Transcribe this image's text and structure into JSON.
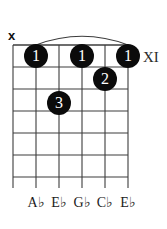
{
  "diagram": {
    "kind": "guitar-chord-diagram",
    "strings": 6,
    "frets": 6,
    "position_label": "XI",
    "colors": {
      "background": "#ffffff",
      "grid": "#3c3c3c",
      "dot_fill": "#0b0b0b",
      "dot_text": "#ffffff",
      "text": "#111111"
    },
    "geometry": {
      "string_x": [
        13,
        36,
        59,
        82,
        105,
        128
      ],
      "fret_y": [
        45,
        67,
        89,
        111,
        133,
        155,
        177
      ],
      "string_tail_y": 188,
      "nut_width": 1.6
    }
  },
  "mute_markers": [
    {
      "name": "mute-string-1",
      "label": "x",
      "string": 1,
      "x": 8,
      "y": 29
    }
  ],
  "barre": {
    "name": "barre-arc",
    "from_string": 2,
    "to_string": 6,
    "fret": 1,
    "apex_y": 33
  },
  "finger_dots": [
    {
      "finger": "1",
      "string": 2,
      "fret": 1,
      "cx": 36,
      "cy": 56
    },
    {
      "finger": "1",
      "string": 4,
      "fret": 1,
      "cx": 82,
      "cy": 56
    },
    {
      "finger": "1",
      "string": 6,
      "fret": 1,
      "cx": 128,
      "cy": 56
    },
    {
      "finger": "2",
      "string": 5,
      "fret": 2,
      "cx": 105,
      "cy": 79
    },
    {
      "finger": "3",
      "string": 3,
      "fret": 3,
      "cx": 59,
      "cy": 103
    }
  ],
  "note_labels": [
    {
      "note": "A♭",
      "string": 2,
      "x": 36,
      "y": 196
    },
    {
      "note": "E♭",
      "string": 3,
      "x": 59,
      "y": 196
    },
    {
      "note": "G♭",
      "string": 4,
      "x": 82,
      "y": 196
    },
    {
      "note": "C♭",
      "string": 5,
      "x": 105,
      "y": 196
    },
    {
      "note": "E♭",
      "string": 6,
      "x": 128,
      "y": 196
    }
  ],
  "position_marker": {
    "label": "XI",
    "x": 143,
    "y": 50
  }
}
